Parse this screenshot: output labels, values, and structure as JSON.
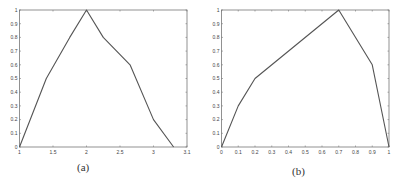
{
  "chart_data": [
    {
      "type": "line",
      "panel_label": "(a)",
      "title": "",
      "xlabel": "",
      "ylabel": "",
      "xlim": [
        1,
        3.5
      ],
      "ylim": [
        0,
        1
      ],
      "grid": false,
      "x_ticks": [
        1,
        1.5,
        2,
        2.5,
        3,
        3.5
      ],
      "x_tick_labels": [
        "1",
        "1.5",
        "2",
        "2.5",
        "3",
        "3.1"
      ],
      "y_ticks": [
        0,
        0.1,
        0.2,
        0.3,
        0.4,
        0.5,
        0.6,
        0.7,
        0.8,
        0.9,
        1
      ],
      "y_tick_labels": [
        "0",
        "0.1",
        "0.2",
        "0.3",
        "0.4",
        "0.5",
        "0.6",
        "0.7",
        "0.8",
        "0.9",
        "1"
      ],
      "series": [
        {
          "name": "membership",
          "x": [
            1,
            1.4,
            1.75,
            2,
            2.25,
            2.65,
            3.0,
            3.3
          ],
          "y": [
            0,
            0.5,
            0.8,
            1.0,
            0.8,
            0.6,
            0.2,
            0
          ]
        }
      ]
    },
    {
      "type": "line",
      "panel_label": "(b)",
      "title": "",
      "xlabel": "",
      "ylabel": "",
      "xlim": [
        0,
        1
      ],
      "ylim": [
        0,
        1
      ],
      "grid": false,
      "x_ticks": [
        0,
        0.1,
        0.2,
        0.3,
        0.4,
        0.5,
        0.6,
        0.7,
        0.8,
        0.9,
        1
      ],
      "x_tick_labels": [
        "0",
        "0.1",
        "0.2",
        "0.3",
        "0.4",
        "0.5",
        "0.6",
        "0.7",
        "0.8",
        "0.9",
        "1"
      ],
      "y_ticks": [
        0,
        0.1,
        0.2,
        0.3,
        0.4,
        0.5,
        0.6,
        0.7,
        0.8,
        0.9,
        1
      ],
      "y_tick_labels": [
        "0",
        "0.1",
        "0.2",
        "0.3",
        "0.4",
        "0.5",
        "0.6",
        "0.7",
        "0.8",
        "0.9",
        "1"
      ],
      "series": [
        {
          "name": "membership",
          "x": [
            0,
            0.1,
            0.2,
            0.7,
            0.9,
            1
          ],
          "y": [
            0,
            0.3,
            0.5,
            1.0,
            0.6,
            0
          ]
        }
      ]
    }
  ],
  "captions": {
    "a": "(a)",
    "b": "(b)"
  },
  "style": {
    "line_color": "#555555",
    "axis_color": "#777777"
  }
}
